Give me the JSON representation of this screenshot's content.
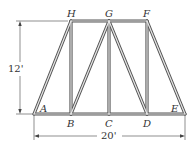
{
  "diagram": {
    "type": "truss",
    "nodes": [
      {
        "id": "A",
        "label": "A",
        "x": 34,
        "y": 114,
        "lx": 40,
        "ly": 112
      },
      {
        "id": "B",
        "label": "B",
        "x": 71,
        "y": 114,
        "lx": 67,
        "ly": 127
      },
      {
        "id": "C",
        "label": "C",
        "x": 109,
        "y": 114,
        "lx": 105,
        "ly": 127
      },
      {
        "id": "D",
        "label": "D",
        "x": 147,
        "y": 114,
        "lx": 143,
        "ly": 127
      },
      {
        "id": "E",
        "label": "E",
        "x": 185,
        "y": 114,
        "lx": 171,
        "ly": 112
      },
      {
        "id": "F",
        "label": "F",
        "x": 147,
        "y": 21,
        "lx": 143,
        "ly": 17
      },
      {
        "id": "G",
        "label": "G",
        "x": 109,
        "y": 21,
        "lx": 105,
        "ly": 17
      },
      {
        "id": "H",
        "label": "H",
        "x": 71,
        "y": 21,
        "lx": 67,
        "ly": 17
      }
    ],
    "members": [
      [
        "A",
        "B"
      ],
      [
        "B",
        "C"
      ],
      [
        "C",
        "D"
      ],
      [
        "D",
        "E"
      ],
      [
        "H",
        "G"
      ],
      [
        "G",
        "F"
      ],
      [
        "A",
        "H"
      ],
      [
        "B",
        "H"
      ],
      [
        "B",
        "G"
      ],
      [
        "C",
        "G"
      ],
      [
        "D",
        "G"
      ],
      [
        "D",
        "F"
      ],
      [
        "E",
        "F"
      ]
    ],
    "dimensions": {
      "height": {
        "label": "12'"
      },
      "width": {
        "label": "20'"
      }
    }
  }
}
